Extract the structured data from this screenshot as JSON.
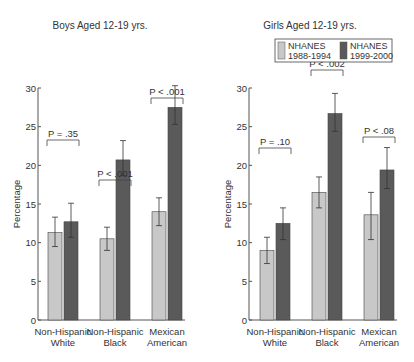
{
  "chart_data": [
    {
      "type": "bar",
      "title": "Boys Aged 12-19 yrs.",
      "xlabel": "",
      "ylabel": "Percentage",
      "ylim": [
        0,
        30
      ],
      "yticks": [
        0,
        5,
        10,
        15,
        20,
        25,
        30
      ],
      "categories": [
        "Non-Hispanic White",
        "Non-Hispanic Black",
        "Mexican American"
      ],
      "category_lines": [
        [
          "Non-Hispanic",
          "White"
        ],
        [
          "Non-Hispanic",
          "Black"
        ],
        [
          "Mexican",
          "American"
        ]
      ],
      "series": [
        {
          "name": "NHANES 1988-1994",
          "color": "#c8c8c8",
          "values": [
            11.3,
            10.5,
            14.0
          ],
          "error_low": [
            9.5,
            9.0,
            12.2
          ],
          "error_high": [
            13.3,
            12.0,
            15.8
          ]
        },
        {
          "name": "NHANES 1999-2000",
          "color": "#5a5a5a",
          "values": [
            12.7,
            20.7,
            27.5
          ],
          "error_low": [
            10.7,
            18.7,
            25.3
          ],
          "error_high": [
            15.1,
            23.2,
            30.3
          ]
        }
      ],
      "annotations": [
        "P = .35",
        "P < .001",
        "P < .001"
      ],
      "grid": false,
      "legend": false
    },
    {
      "type": "bar",
      "title": "Girls Aged 12-19 yrs.",
      "xlabel": "",
      "ylabel": "Percentage",
      "ylim": [
        0,
        30
      ],
      "yticks": [
        0,
        5,
        10,
        15,
        20,
        25,
        30
      ],
      "categories": [
        "Non-Hispanic White",
        "Non-Hispanic Black",
        "Mexican American"
      ],
      "category_lines": [
        [
          "Non-Hispanic",
          "White"
        ],
        [
          "Non-Hispanic",
          "Black"
        ],
        [
          "Mexican",
          "American"
        ]
      ],
      "series": [
        {
          "name": "NHANES 1988-1994",
          "color": "#c8c8c8",
          "values": [
            9.0,
            16.5,
            13.6
          ],
          "error_low": [
            7.3,
            14.5,
            10.4
          ],
          "error_high": [
            10.7,
            18.5,
            16.5
          ]
        },
        {
          "name": "NHANES 1999-2000",
          "color": "#5a5a5a",
          "values": [
            12.5,
            26.7,
            19.4
          ],
          "error_low": [
            10.4,
            24.4,
            17.0
          ],
          "error_high": [
            14.5,
            29.3,
            22.3
          ]
        }
      ],
      "annotations": [
        "P = .10",
        "P < .002",
        "P < .08"
      ],
      "grid": false,
      "legend": true,
      "legend_position": "top-right",
      "legend_entries": [
        {
          "lines": [
            "NHANES",
            "1988-1994"
          ],
          "color": "#c8c8c8"
        },
        {
          "lines": [
            "NHANES",
            "1999-2000"
          ],
          "color": "#5a5a5a"
        }
      ]
    }
  ]
}
